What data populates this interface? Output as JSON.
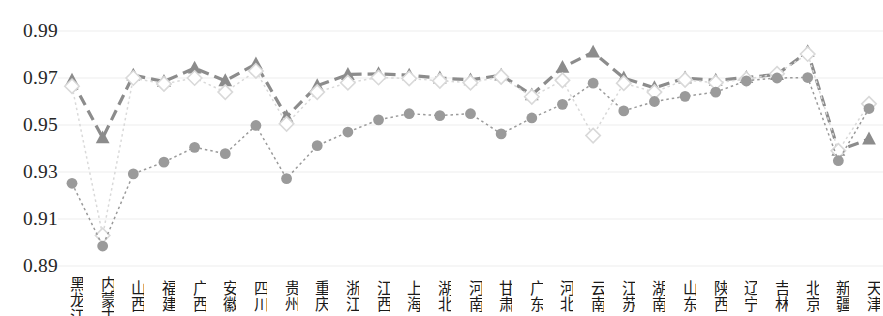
{
  "chart_data": {
    "type": "line",
    "title": "",
    "xlabel": "",
    "ylabel": "",
    "ylim": [
      0.89,
      0.99
    ],
    "yticks": [
      "0.89",
      "0.91",
      "0.93",
      "0.95",
      "0.97",
      "0.99"
    ],
    "grid": true,
    "legend": "none",
    "categories": [
      "黑龙江",
      "内蒙古",
      "山西",
      "福建",
      "广西",
      "安徽",
      "四川",
      "贵州",
      "重庆",
      "浙江",
      "江西",
      "上海",
      "湖北",
      "河南",
      "甘肃",
      "广东",
      "河北",
      "云南",
      "江苏",
      "湖南",
      "山东",
      "陕西",
      "辽宁",
      "吉林",
      "北京",
      "新疆",
      "天津"
    ],
    "series": [
      {
        "name": "series-triangle",
        "marker": "triangle",
        "color": "#8c8c8c",
        "linestyle": "dashed",
        "values": [
          0.969,
          0.9445,
          0.9712,
          0.9685,
          0.9742,
          0.9688,
          0.976,
          0.9535,
          0.9667,
          0.9715,
          0.9718,
          0.9712,
          0.97,
          0.9692,
          0.9712,
          0.9628,
          0.9745,
          0.981,
          0.97,
          0.9658,
          0.97,
          0.969,
          0.9702,
          0.9715,
          0.9812,
          0.9392,
          0.944
        ]
      },
      {
        "name": "series-diamond",
        "marker": "diamond-open",
        "color": "#d9d9d9",
        "linestyle": "dotted",
        "values": [
          0.9665,
          0.903,
          0.97,
          0.9675,
          0.97,
          0.964,
          0.973,
          0.9505,
          0.964,
          0.968,
          0.9702,
          0.9698,
          0.9688,
          0.968,
          0.9705,
          0.962,
          0.969,
          0.9455,
          0.9678,
          0.964,
          0.9692,
          0.968,
          0.9695,
          0.9718,
          0.9802,
          0.939,
          0.959
        ]
      },
      {
        "name": "series-circle",
        "marker": "circle",
        "color": "#9a9a9a",
        "linestyle": "dotted",
        "values": [
          0.9252,
          0.8985,
          0.9292,
          0.9342,
          0.9405,
          0.9378,
          0.9498,
          0.9272,
          0.9412,
          0.947,
          0.9522,
          0.9548,
          0.954,
          0.9548,
          0.9462,
          0.953,
          0.9588,
          0.9678,
          0.956,
          0.96,
          0.9622,
          0.964,
          0.9688,
          0.97,
          0.9702,
          0.9348,
          0.957
        ]
      }
    ]
  }
}
